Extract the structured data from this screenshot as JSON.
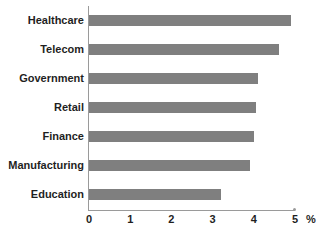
{
  "chart_data": {
    "type": "bar",
    "orientation": "horizontal",
    "title": "",
    "xlabel": "%",
    "ylabel": "",
    "categories": [
      "Healthcare",
      "Telecom",
      "Government",
      "Retail",
      "Finance",
      "Manufacturing",
      "Education"
    ],
    "values": [
      4.9,
      4.6,
      4.1,
      4.05,
      4.0,
      3.9,
      3.2
    ],
    "xlim": [
      0,
      5
    ],
    "xticks": [
      0,
      1,
      2,
      3,
      4,
      5
    ],
    "xtick_labels": [
      "0",
      "1",
      "2",
      "3",
      "4",
      "5"
    ],
    "grid": false,
    "legend": null,
    "series": [
      {
        "name": "",
        "values": [
          4.9,
          4.6,
          4.1,
          4.05,
          4.0,
          3.9,
          3.2
        ],
        "color": "#7f7f7f"
      }
    ]
  },
  "axis": {
    "unit_label": "%",
    "line_color": "#9a9a9a"
  },
  "style": {
    "bar_color": "#7f7f7f",
    "background": "#ffffff",
    "text_color": "#1f1f1f"
  }
}
